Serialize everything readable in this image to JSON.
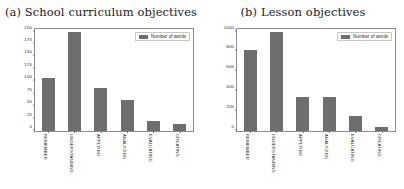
{
  "figure": {
    "background": "#ffffff",
    "bar_color": "#6e6e6e",
    "axis_color": "#8d8d8d"
  },
  "panels": [
    {
      "title": "(a) School curriculum objectives",
      "legend_label": "Number of words"
    },
    {
      "title": "(b) Lesson objectives",
      "legend_label": "Number of words"
    }
  ],
  "chart_data": [
    {
      "type": "bar",
      "title": "(a) School curriculum objectives",
      "categories": [
        "REMEMBER",
        "UNDERSTANDING",
        "APPLYING",
        "ANALYZING",
        "EVALUATING",
        "CREATING"
      ],
      "series": [
        {
          "name": "Number of words",
          "values": [
            107,
            199,
            87,
            63,
            21,
            14
          ]
        }
      ],
      "values": [
        107,
        199,
        87,
        63,
        21,
        14
      ],
      "yticks": [
        0,
        25,
        50,
        75,
        100,
        125,
        150,
        175,
        200
      ],
      "ytick_labels": [
        "0",
        "25",
        "50",
        "75",
        "100",
        "125",
        "150",
        "175",
        "200"
      ],
      "ylim": [
        0,
        205
      ],
      "xlabel": "",
      "ylabel": "",
      "grid": false,
      "legend_position": "upper right",
      "xtick_rotation": 90
    },
    {
      "type": "bar",
      "title": "(b) Lesson objectives",
      "categories": [
        "REMEMBER",
        "UNDERSTANDING",
        "APPLYING",
        "ANALYZING",
        "EVALUATING",
        "CREATING"
      ],
      "series": [
        {
          "name": "Number of words",
          "values": [
            815,
            995,
            338,
            340,
            148,
            42
          ]
        }
      ],
      "values": [
        815,
        995,
        338,
        340,
        148,
        42
      ],
      "yticks": [
        0,
        200,
        400,
        600,
        800,
        1000
      ],
      "ytick_labels": [
        "0",
        "200",
        "400",
        "600",
        "800",
        "1000"
      ],
      "ylim": [
        0,
        1025
      ],
      "xlabel": "",
      "ylabel": "",
      "grid": false,
      "legend_position": "upper right",
      "xtick_rotation": 90
    }
  ]
}
